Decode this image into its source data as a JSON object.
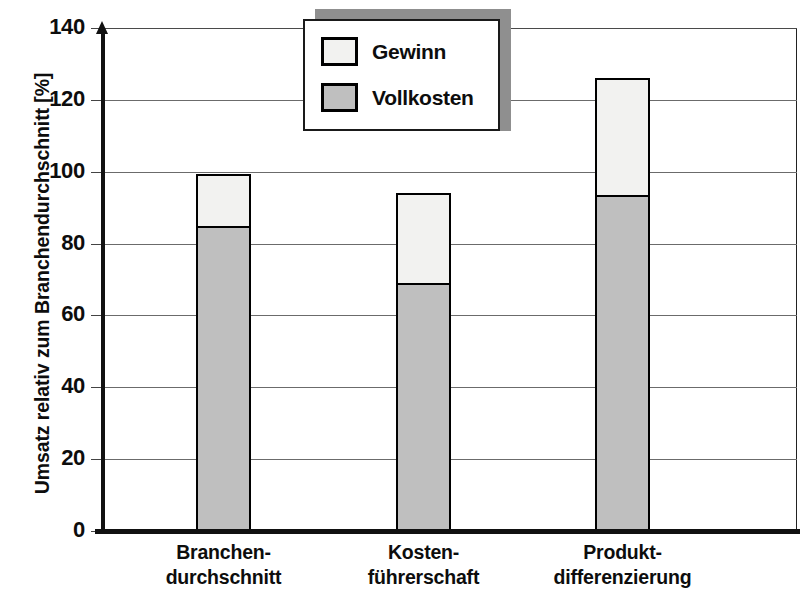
{
  "chart_data": {
    "type": "bar",
    "subtype": "stacked-bar",
    "title": "",
    "xlabel": "",
    "ylabel": "Umsatz relativ zum Branchendurchschnitt [%]",
    "ylim": [
      0,
      140
    ],
    "yticks": [
      0,
      20,
      40,
      60,
      80,
      100,
      120,
      140
    ],
    "grid": "horizontal",
    "legend_position": "top-center",
    "categories": [
      "Branchen-\ndurchschnitt",
      "Kosten-\nführerschaft",
      "Produkt-\ndifferenzierung"
    ],
    "category_lines": [
      [
        "Branchen-",
        "durchschnitt"
      ],
      [
        "Kosten-",
        "führerschaft"
      ],
      [
        "Produkt-",
        "differenzierung"
      ]
    ],
    "series": [
      {
        "name": "Vollkosten",
        "values": [
          85,
          69,
          93.5
        ],
        "color": "#bfbfbf"
      },
      {
        "name": "Gewinn",
        "values": [
          14.5,
          25,
          32.5
        ],
        "color": "#f2f2f0"
      }
    ],
    "totals": [
      99.5,
      94,
      126
    ]
  },
  "axis": {
    "y_title": "Umsatz relativ zum Branchendurchschnitt [%]",
    "tick_labels": [
      "140",
      "120",
      "100",
      "80",
      "60",
      "40",
      "20",
      "0"
    ]
  },
  "legend": {
    "items": [
      {
        "label": "Gewinn",
        "swatch_color": "#f2f2f0"
      },
      {
        "label": "Vollkosten",
        "swatch_color": "#bfbfbf"
      }
    ]
  },
  "categories": [
    {
      "line1": "Branchen-",
      "line2": "durchschnitt"
    },
    {
      "line1": "Kosten-",
      "line2": "führerschaft"
    },
    {
      "line1": "Produkt-",
      "line2": "differenzierung"
    }
  ],
  "colors": {
    "cost_gray": "#bfbfbf",
    "profit_light": "#f2f2f0",
    "outline": "#000000",
    "gridline": "#6b6b6b"
  }
}
